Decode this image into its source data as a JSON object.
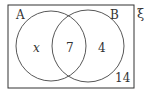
{
  "diagram": {
    "type": "venn",
    "universal_label": "ξ",
    "sets": [
      {
        "label": "A"
      },
      {
        "label": "B"
      }
    ],
    "regions": {
      "a_only": "x",
      "a_and_b": "7",
      "b_only": "4",
      "outside": "14"
    }
  }
}
